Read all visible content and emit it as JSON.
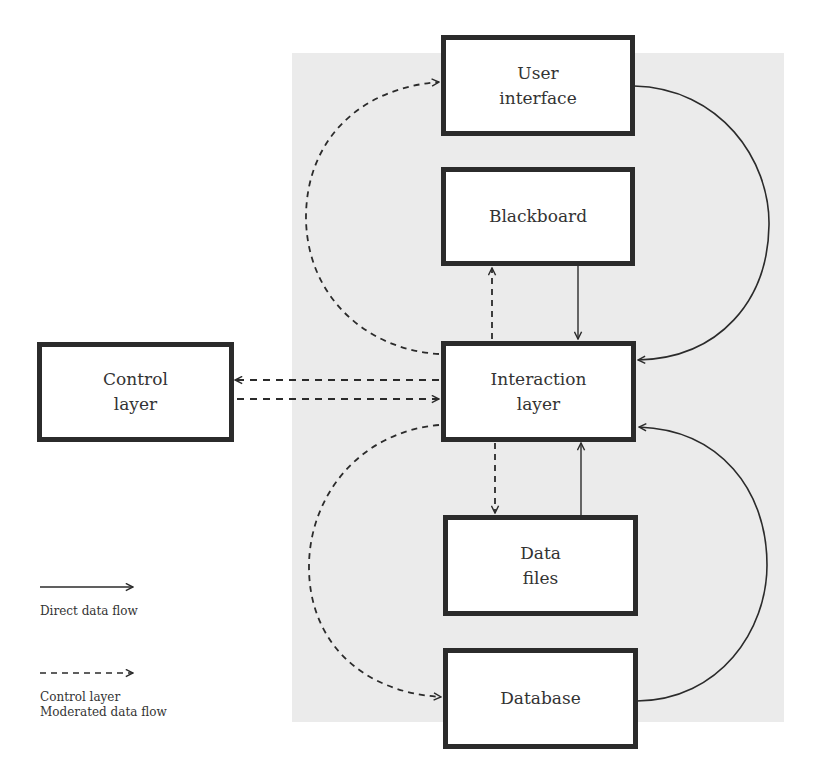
{
  "diagram": {
    "nodes": [
      {
        "id": "user_interface",
        "label": "User\ninterface"
      },
      {
        "id": "blackboard",
        "label": "Blackboard"
      },
      {
        "id": "interaction_layer",
        "label": "Interaction\nlayer"
      },
      {
        "id": "control_layer",
        "label": "Control\nlayer"
      },
      {
        "id": "data_files",
        "label": "Data\nfiles"
      },
      {
        "id": "database",
        "label": "Database"
      }
    ],
    "edges": [
      {
        "from": "user_interface",
        "to": "interaction_layer",
        "style": "solid"
      },
      {
        "from": "blackboard",
        "to": "interaction_layer",
        "style": "solid"
      },
      {
        "from": "interaction_layer",
        "to": "blackboard",
        "style": "dashed"
      },
      {
        "from": "interaction_layer",
        "to": "user_interface",
        "style": "dashed"
      },
      {
        "from": "interaction_layer",
        "to": "control_layer",
        "style": "dashed"
      },
      {
        "from": "control_layer",
        "to": "interaction_layer",
        "style": "dashed"
      },
      {
        "from": "interaction_layer",
        "to": "data_files",
        "style": "dashed"
      },
      {
        "from": "data_files",
        "to": "interaction_layer",
        "style": "solid"
      },
      {
        "from": "interaction_layer",
        "to": "database",
        "style": "dashed"
      },
      {
        "from": "database",
        "to": "interaction_layer",
        "style": "solid"
      }
    ]
  },
  "legend": {
    "direct": {
      "label": "Direct data flow",
      "style": "solid"
    },
    "moderated": {
      "label": "Control layer\nModerated data flow",
      "style": "dashed"
    }
  },
  "colors": {
    "stroke": "#2b2b2b",
    "panel": "#ebebeb",
    "node_fill": "#ffffff"
  }
}
